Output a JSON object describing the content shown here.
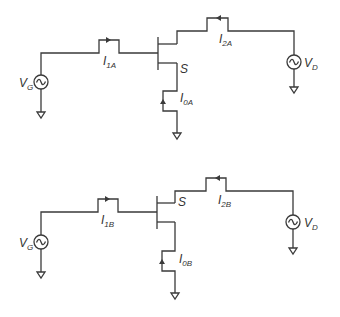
{
  "diagram": {
    "type": "circuit-schematic",
    "colors": {
      "wire": "#3a3a3a",
      "text": "#333333",
      "background": "#ffffff"
    },
    "circuits": [
      {
        "id": "A",
        "gate_source": {
          "label_main": "V",
          "label_sub": "G",
          "symbol": "ac-source-icon"
        },
        "drain_source": {
          "label_main": "V",
          "label_sub": "D",
          "symbol": "ac-source-icon"
        },
        "source_terminal": {
          "label": "S"
        },
        "currents": [
          {
            "label_main": "I",
            "label_sub": "1A",
            "direction": "right"
          },
          {
            "label_main": "I",
            "label_sub": "2A",
            "direction": "left"
          },
          {
            "label_main": "I",
            "label_sub": "0A",
            "direction": "up"
          }
        ]
      },
      {
        "id": "B",
        "gate_source": {
          "label_main": "V",
          "label_sub": "G",
          "symbol": "ac-source-icon"
        },
        "drain_source": {
          "label_main": "V",
          "label_sub": "D",
          "symbol": "ac-source-icon"
        },
        "source_terminal": {
          "label": "S"
        },
        "currents": [
          {
            "label_main": "I",
            "label_sub": "1B",
            "direction": "right"
          },
          {
            "label_main": "I",
            "label_sub": "2B",
            "direction": "left"
          },
          {
            "label_main": "I",
            "label_sub": "0B",
            "direction": "up"
          }
        ]
      }
    ]
  }
}
